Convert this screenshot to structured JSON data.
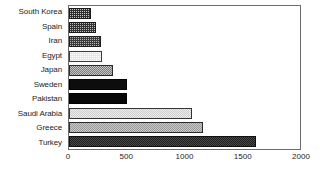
{
  "chart_data": {
    "type": "bar",
    "orientation": "horizontal",
    "title": "",
    "subtitle": "",
    "xlabel": "",
    "ylabel": "",
    "xlim": [
      0,
      2000
    ],
    "xticks": [
      0,
      500,
      1000,
      1500,
      2000
    ],
    "xtick_labels": [
      "0",
      "500",
      "1000",
      "1500",
      "2000"
    ],
    "grid": false,
    "legend": null,
    "categories": [
      "South Korea",
      "Spain",
      "Iran",
      "Egypt",
      "Japan",
      "Sweden",
      "Pakistan",
      "Saudi Arabia",
      "Greece",
      "Turkey"
    ],
    "values": [
      190,
      235,
      275,
      285,
      380,
      500,
      505,
      1065,
      1160,
      1620
    ],
    "bars": [
      {
        "category": "South Korea",
        "value": 190,
        "fill": "fill-dark-dot",
        "color": "#2e2e2e"
      },
      {
        "category": "Spain",
        "value": 235,
        "fill": "fill-dark-dot2",
        "color": "#333333"
      },
      {
        "category": "Iran",
        "value": 275,
        "fill": "fill-dark-grid",
        "color": "#3b3b3b"
      },
      {
        "category": "Egypt",
        "value": 285,
        "fill": "fill-light",
        "color": "#e7e7e7"
      },
      {
        "category": "Japan",
        "value": 380,
        "fill": "fill-mid-check",
        "color": "#8e8e8e"
      },
      {
        "category": "Sweden",
        "value": 500,
        "fill": "fill-solid-black",
        "color": "#0d0d0d"
      },
      {
        "category": "Pakistan",
        "value": 505,
        "fill": "fill-solid-black2",
        "color": "#070707"
      },
      {
        "category": "Saudi Arabia",
        "value": 1065,
        "fill": "fill-pale",
        "color": "#d8d8d8"
      },
      {
        "category": "Greece",
        "value": 1160,
        "fill": "fill-mid-grey",
        "color": "#a9a9a9"
      },
      {
        "category": "Turkey",
        "value": 1620,
        "fill": "fill-charcoal",
        "color": "#262626"
      }
    ]
  },
  "style": {
    "plot_border_color": "#6d6d6d",
    "text_color": "#1c1c1c",
    "background": "#ffffff"
  }
}
